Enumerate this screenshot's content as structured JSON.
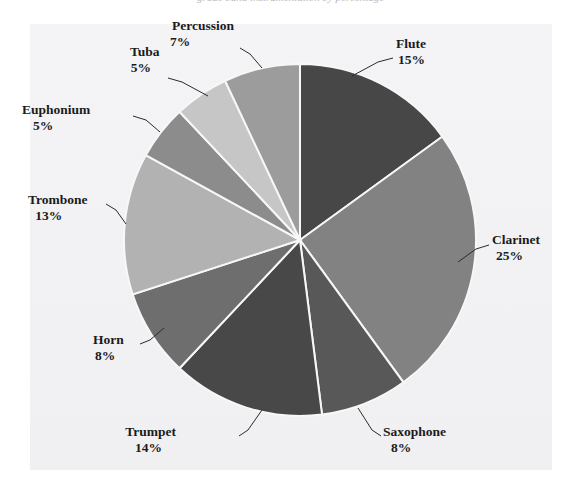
{
  "figure": {
    "title_remnant": "grade band instrumentation by percentage",
    "background_color": "#f2f2f4",
    "page_background": "#ffffff",
    "label_color": "#1b1b1b",
    "slice_border_color": "#f7f7f7"
  },
  "chart_data": {
    "type": "pie",
    "title": "",
    "xlabel": "",
    "ylabel": "",
    "grid": false,
    "legend_position": "none",
    "labels_outside": true,
    "start_angle_deg": 0,
    "direction": "clockwise",
    "total_percent": 100,
    "categories": [
      "Flute",
      "Clarinet",
      "Saxophone",
      "Trumpet",
      "Horn",
      "Trombone",
      "Euphonium",
      "Tuba",
      "Percussion"
    ],
    "values": [
      15,
      25,
      8,
      14,
      8,
      13,
      5,
      5,
      7
    ],
    "value_labels": [
      "15%",
      "25%",
      "8%",
      "14%",
      "8%",
      "13%",
      "5%",
      "5%",
      "7%"
    ],
    "colors": [
      "#474747",
      "#828282",
      "#585858",
      "#484848",
      "#6e6e6e",
      "#b2b2b2",
      "#8c8c8c",
      "#c6c6c6",
      "#9c9c9c"
    ],
    "slices": [
      {
        "label": "Flute",
        "value": 15,
        "value_label": "15%",
        "color": "#474747"
      },
      {
        "label": "Clarinet",
        "value": 25,
        "value_label": "25%",
        "color": "#828282"
      },
      {
        "label": "Saxophone",
        "value": 8,
        "value_label": "8%",
        "color": "#585858"
      },
      {
        "label": "Trumpet",
        "value": 14,
        "value_label": "14%",
        "color": "#484848"
      },
      {
        "label": "Horn",
        "value": 8,
        "value_label": "8%",
        "color": "#6e6e6e"
      },
      {
        "label": "Trombone",
        "value": 13,
        "value_label": "13%",
        "color": "#b2b2b2"
      },
      {
        "label": "Euphonium",
        "value": 5,
        "value_label": "5%",
        "color": "#8c8c8c"
      },
      {
        "label": "Tuba",
        "value": 5,
        "value_label": "5%",
        "color": "#c6c6c6"
      },
      {
        "label": "Percussion",
        "value": 7,
        "value_label": "7%",
        "color": "#9c9c9c"
      }
    ]
  }
}
